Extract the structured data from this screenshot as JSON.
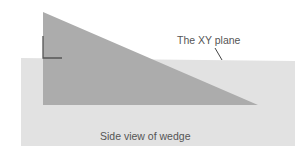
{
  "figure": {
    "labels": {
      "plane": "The XY plane",
      "caption": "Side view of wedge"
    },
    "colors": {
      "background": "#ffffff",
      "plane_fill": "#e2e2e2",
      "wedge_fill": "#acacac",
      "marker_stroke": "#555555",
      "leader_stroke": "#444444",
      "text": "#555555"
    },
    "shapes": {
      "plane": {
        "x": 21,
        "y": 59,
        "width": 274,
        "height": 87
      },
      "wedge": {
        "points": [
          [
            43,
            12
          ],
          [
            258,
            105
          ],
          [
            43,
            105
          ]
        ]
      },
      "right_angle_marker": {
        "vertical": [
          [
            43,
            36
          ],
          [
            43,
            58
          ]
        ],
        "horizontal": [
          [
            43,
            58
          ],
          [
            62,
            58
          ]
        ]
      },
      "leader_line": [
        [
          215,
          48
        ],
        [
          222,
          60
        ]
      ]
    }
  }
}
